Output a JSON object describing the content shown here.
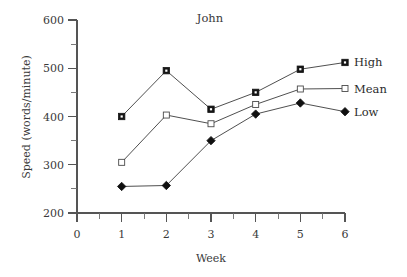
{
  "chart_data": {
    "type": "line",
    "title": "John",
    "xlabel": "Week",
    "ylabel": "Speed (words/minute)",
    "x": [
      1,
      2,
      3,
      4,
      5,
      6
    ],
    "categories": [
      "1",
      "2",
      "3",
      "4",
      "5",
      "6"
    ],
    "xlim": [
      0,
      6
    ],
    "ylim": [
      200,
      600
    ],
    "xticks": [
      0,
      1,
      2,
      3,
      4,
      5,
      6
    ],
    "xtick_labels": [
      "0",
      "1",
      "2",
      "3",
      "4",
      "5",
      "6"
    ],
    "xminor_ticks": [
      0.5,
      1.5,
      2.5,
      3.5,
      4.5,
      5.5
    ],
    "yticks": [
      200,
      300,
      400,
      500,
      600
    ],
    "ytick_labels": [
      "200",
      "300",
      "400",
      "500",
      "600"
    ],
    "yminor_ticks": [
      250,
      350,
      450,
      550
    ],
    "grid": false,
    "legend_position": "right-inline-at-last-point",
    "series": [
      {
        "name": "High",
        "marker": "filled-square",
        "color": "#151515",
        "values": [
          400,
          495,
          415,
          450,
          498,
          512
        ]
      },
      {
        "name": "Mean",
        "marker": "open-square",
        "color": "#ffffff",
        "values": [
          305,
          403,
          385,
          425,
          457,
          458
        ]
      },
      {
        "name": "Low",
        "marker": "filled-diamond",
        "color": "#101010",
        "values": [
          255,
          257,
          350,
          405,
          428,
          410
        ]
      }
    ]
  },
  "legend": {
    "items": [
      {
        "label": "High",
        "marker": "filled-square"
      },
      {
        "label": "Mean",
        "marker": "open-square"
      },
      {
        "label": "Low",
        "marker": "filled-diamond"
      }
    ]
  },
  "axes": {
    "x_title": "Week",
    "y_title": "Speed (words/minute)"
  },
  "colors": {
    "background": "#ffffff",
    "axis": "#555555",
    "line": "#3b3b3b",
    "text": "#2b2b2b"
  }
}
